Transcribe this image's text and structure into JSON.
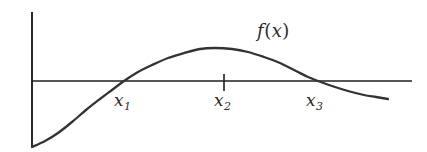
{
  "figure": {
    "background_color": "#ffffff",
    "stroke_color": "#333333",
    "axis_color": "#1f1f1f",
    "width": 427,
    "height": 152
  },
  "labels": {
    "function_label": "f",
    "function_open_paren": "(",
    "function_arg": "x",
    "function_close_paren": ")",
    "root1_base": "x",
    "root1_sub": "1",
    "root2_base": "x",
    "root2_sub": "2",
    "root3_base": "x",
    "root3_sub": "3"
  },
  "chart_data": {
    "type": "line",
    "title": "",
    "xlabel": "",
    "ylabel": "",
    "legend": [
      "f(x)"
    ],
    "grid": false,
    "axes": {
      "x_axis_y_px": 81,
      "x_axis_start_px": 32,
      "x_axis_end_px": 412,
      "y_axis_x_px": 32,
      "y_axis_top_px": 12,
      "y_axis_bottom_px": 147,
      "arrowheads": false
    },
    "ticks": [
      {
        "label": "x_2",
        "x_px": 224,
        "tick_top_px": 74,
        "tick_bottom_px": 91
      }
    ],
    "annotations": [
      {
        "text": "x_1",
        "x_px": 124,
        "kind": "root-label",
        "below_axis": true
      },
      {
        "text": "x_2",
        "x_px": 224,
        "kind": "root-label",
        "below_axis": true
      },
      {
        "text": "x_3",
        "x_px": 318,
        "kind": "root-label",
        "below_axis": true
      },
      {
        "text": "f(x)",
        "x_px": 278,
        "y_px": 33,
        "kind": "curve-label"
      }
    ],
    "roots_px": [
      124,
      224,
      318
    ],
    "extrema_px": [
      {
        "type": "minimum",
        "x_px": 32,
        "y_px": 147
      },
      {
        "type": "maximum",
        "x_px": 215,
        "y_px": 48
      }
    ],
    "series": [
      {
        "name": "f(x)",
        "points_px": [
          [
            32,
            147
          ],
          [
            45,
            141
          ],
          [
            58,
            133
          ],
          [
            72,
            122
          ],
          [
            86,
            110
          ],
          [
            100,
            99
          ],
          [
            112,
            90
          ],
          [
            124,
            81
          ],
          [
            138,
            72
          ],
          [
            152,
            65
          ],
          [
            168,
            58
          ],
          [
            184,
            53
          ],
          [
            200,
            49
          ],
          [
            215,
            48
          ],
          [
            232,
            49
          ],
          [
            248,
            52
          ],
          [
            264,
            57
          ],
          [
            280,
            63
          ],
          [
            296,
            71
          ],
          [
            308,
            77
          ],
          [
            318,
            81
          ],
          [
            332,
            86
          ],
          [
            348,
            91
          ],
          [
            364,
            95
          ],
          [
            376,
            97
          ],
          [
            388,
            99
          ]
        ]
      }
    ]
  }
}
